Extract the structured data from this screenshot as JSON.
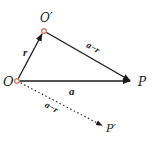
{
  "diagram": {
    "type": "vector-diagram",
    "colors": {
      "line": "#1a1a1a",
      "point_marker": "#d9806a",
      "background": "#ffffff"
    },
    "points": {
      "O": {
        "label": "O",
        "x": 17,
        "y": 81
      },
      "O_prime": {
        "label": "O′",
        "x": 44,
        "y": 31
      },
      "P": {
        "label": "P",
        "x": 131,
        "y": 81
      },
      "P_prime": {
        "label": "P′",
        "x": 103,
        "y": 126
      }
    },
    "vectors": [
      {
        "from": "O",
        "to": "O_prime",
        "label": "r",
        "style": "solid"
      },
      {
        "from": "O_prime",
        "to": "P",
        "label": "a−r",
        "style": "solid"
      },
      {
        "from": "O",
        "to": "P",
        "label": "a",
        "style": "solid"
      },
      {
        "from": "O",
        "to": "P_prime",
        "label": "a−r",
        "style": "dotted"
      }
    ]
  }
}
